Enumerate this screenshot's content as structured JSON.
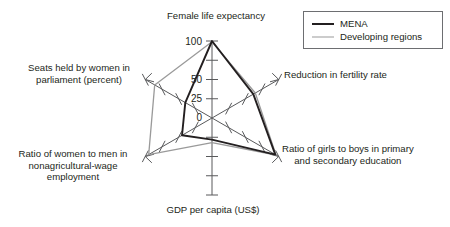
{
  "chart_data": {
    "type": "radar",
    "title": "",
    "categories": [
      "Female life expectancy",
      "Reduction in fertility rate",
      "Ratio of girls to boys in primary and secondary education",
      "GDP per capita (US$)",
      "Ratio of women to men in nonagricultural-wage employment",
      "Seats held by women in parliament (percent)"
    ],
    "series": [
      {
        "name": "MENA",
        "color": "#231f20",
        "values": [
          100,
          62,
          95,
          28,
          45,
          40
        ]
      },
      {
        "name": "Developing regions",
        "color": "#9a9a9a",
        "values": [
          99,
          65,
          96,
          32,
          95,
          86
        ]
      }
    ],
    "rlim": [
      0,
      100
    ],
    "tick_values": [
      0,
      25,
      50,
      75,
      100
    ],
    "tick_labels_shown": [
      "0",
      "25",
      "50",
      "100"
    ],
    "grid": false,
    "legend_position": "top-right"
  },
  "axis_labels": {
    "top": "Female life expectancy",
    "fertility": "Reduction in fertility rate",
    "education_line1": "Ratio of girls to boys in primary",
    "education_line2": "and secondary education",
    "gdp": "GDP per capita (US$)",
    "wage_line1": "Ratio of women to men in",
    "wage_line2": "nonagricultural-wage",
    "wage_line3": "employment",
    "parliament_line1": "Seats held by women in",
    "parliament_line2": "parliament (percent)"
  },
  "scale": {
    "t0": "0",
    "t25": "25",
    "t50": "50",
    "t100": "100"
  },
  "legend": {
    "items": [
      {
        "label": "MENA"
      },
      {
        "label": "Developing regions"
      }
    ]
  }
}
